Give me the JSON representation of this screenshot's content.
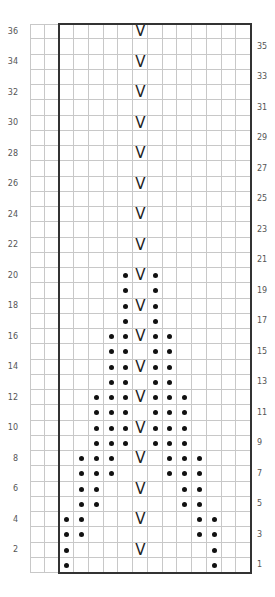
{
  "chart": {
    "columns": 15,
    "rows": 36,
    "framed_columns": [
      2,
      14
    ],
    "legend_symbols": {
      "slip": "V",
      "purl": "•"
    },
    "row_labels_left": [
      "2",
      "4",
      "6",
      "8",
      "10",
      "12",
      "14",
      "16",
      "18",
      "20",
      "22",
      "24",
      "26",
      "28",
      "30",
      "32",
      "34",
      "36"
    ],
    "row_labels_right": [
      "1",
      "3",
      "5",
      "7",
      "9",
      "11",
      "13",
      "15",
      "17",
      "19",
      "21",
      "23",
      "25",
      "27",
      "29",
      "31",
      "33",
      "35"
    ],
    "slip_rows": [
      2,
      4,
      6,
      8,
      10,
      12,
      14,
      16,
      18,
      20,
      22,
      24,
      26,
      28,
      30,
      32,
      34,
      36
    ],
    "slip_column": 7,
    "purl_cells": {
      "1": [
        2,
        12
      ],
      "2": [
        2,
        12
      ],
      "3": [
        2,
        3,
        11,
        12
      ],
      "4": [
        2,
        3,
        11,
        12
      ],
      "5": [
        3,
        4,
        10,
        11
      ],
      "6": [
        3,
        4,
        10,
        11
      ],
      "7": [
        3,
        4,
        5,
        9,
        10,
        11
      ],
      "8": [
        3,
        4,
        5,
        9,
        10,
        11
      ],
      "9": [
        4,
        5,
        6,
        8,
        9,
        10
      ],
      "10": [
        4,
        5,
        6,
        8,
        9,
        10
      ],
      "11": [
        4,
        5,
        6,
        8,
        9,
        10
      ],
      "12": [
        4,
        5,
        6,
        8,
        9,
        10
      ],
      "13": [
        5,
        6,
        8,
        9
      ],
      "14": [
        5,
        6,
        8,
        9
      ],
      "15": [
        5,
        6,
        8,
        9
      ],
      "16": [
        5,
        6,
        8,
        9
      ],
      "17": [
        6,
        8
      ],
      "18": [
        6,
        8
      ],
      "19": [
        6,
        8
      ],
      "20": [
        6,
        8
      ]
    }
  }
}
